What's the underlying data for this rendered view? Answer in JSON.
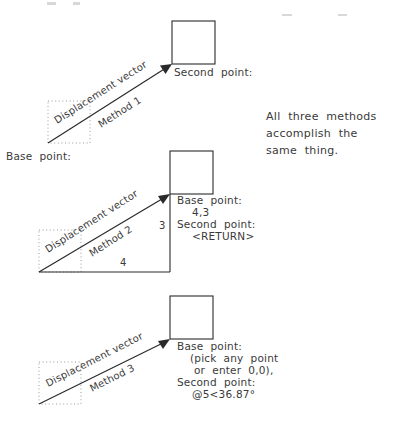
{
  "figure": {
    "ink_color": "#2a2a2a",
    "ghost_color": "#9a9a9a",
    "text_color": "#3a3a3a",
    "background": "#ffffff"
  },
  "side_note": {
    "line1": "All  three  methods",
    "line2": "accomplish  the",
    "line3": "same  thing."
  },
  "methods": [
    {
      "id": "method-1",
      "vector_label": "Displacement vector",
      "method_label": "Method 1",
      "base_point_label": "Base  point:",
      "second_point_label": "Second  point:"
    },
    {
      "id": "method-2",
      "vector_label": "Displacement vector",
      "method_label": "Method 2",
      "leg_vertical": "3",
      "leg_horizontal": "4",
      "prompt_line1": "Base  point:",
      "prompt_line2": "4,3",
      "prompt_line3": "Second  point:",
      "prompt_line4": "<RETURN>"
    },
    {
      "id": "method-3",
      "vector_label": "Displacement vector",
      "method_label": "Method 3",
      "prompt_line1": "Base  point:",
      "prompt_line2": "(pick  any  point",
      "prompt_line3": "or  enter  0,0),",
      "prompt_line4": "Second  point:",
      "prompt_line5": "@5<36.87°"
    }
  ]
}
